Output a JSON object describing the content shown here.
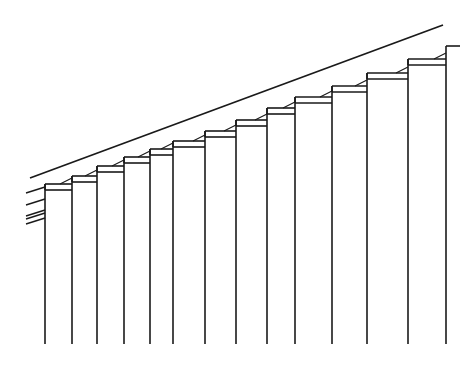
{
  "diagram": {
    "stroke_color": "#1a1a1a",
    "background": "#ffffff",
    "pillar_xs": [
      45,
      72,
      97,
      124,
      150,
      173,
      205,
      236,
      267,
      295,
      332,
      367,
      408,
      446
    ],
    "pillar_tops": [
      184,
      176,
      166,
      157,
      149,
      141,
      131,
      120,
      108,
      97,
      86,
      73,
      59,
      46
    ],
    "pillar_bottom": 344
  }
}
